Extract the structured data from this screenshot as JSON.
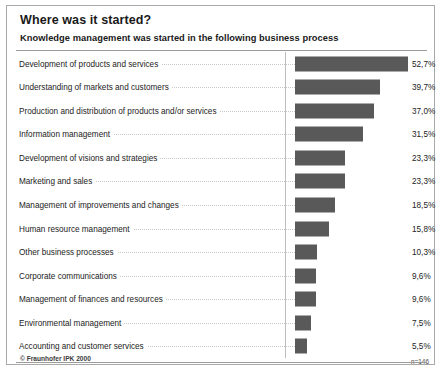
{
  "header": {
    "title": "Where was it started?",
    "subtitle": "Knowledge management was started in the following business process"
  },
  "footer": {
    "copyright": "© Fraunhofer IPK 2000",
    "sample_note": "n=146"
  },
  "colors": {
    "bar": "#595959",
    "frame_border": "#a9a9a9",
    "rule": "#9b9b9b",
    "leader": "#c8c8c8",
    "text": "#232323",
    "background": "#ffffff"
  },
  "chart_data": {
    "type": "bar",
    "orientation": "horizontal",
    "title": "Where was it started?",
    "subtitle": "Knowledge management was started in the following business process",
    "xlabel": "",
    "ylabel": "",
    "xlim": [
      0,
      55
    ],
    "grid": false,
    "legend": false,
    "value_suffix": "%",
    "decimal_separator": ",",
    "sample_size": "n=146",
    "categories": [
      "Development of products and services",
      "Understanding of markets and customers",
      "Production and distribution of products and/or services",
      "Information management",
      "Development of visions and strategies",
      "Marketing and sales",
      "Management of improvements and changes",
      "Human resource management",
      "Other business processes",
      "Corporate communications",
      "Management of finances and resources",
      "Environmental management",
      "Accounting and customer services"
    ],
    "values": [
      52.7,
      39.7,
      37.0,
      31.5,
      23.3,
      23.3,
      18.5,
      15.8,
      10.3,
      9.6,
      9.6,
      7.5,
      5.5
    ],
    "value_labels": [
      "52,7%",
      "39,7%",
      "37,0%",
      "31,5%",
      "23,3%",
      "23,3%",
      "18,5%",
      "15,8%",
      "10,3%",
      "9,6%",
      "9,6%",
      "7,5%",
      "5,5%"
    ]
  }
}
